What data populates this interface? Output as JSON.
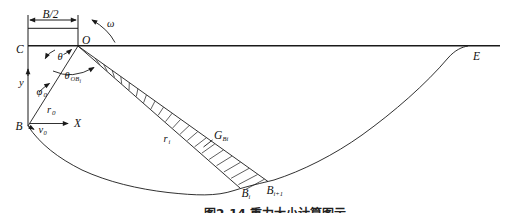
{
  "dim": {
    "label": "B/2"
  },
  "points": {
    "C": "C",
    "O": "O",
    "B": "B",
    "E": "E"
  },
  "axes": {
    "x": "X",
    "y": "y"
  },
  "angles": {
    "omega": "ω",
    "theta": "θ",
    "thetaOB": {
      "main": "θ",
      "sub": "OB",
      "subi": "i"
    },
    "phi": {
      "main": "φ",
      "sub": "0"
    }
  },
  "radii": {
    "r0": {
      "main": "r",
      "sub": "0"
    },
    "ri": {
      "main": "r",
      "sub": "i"
    }
  },
  "velocity": {
    "main": "v",
    "sub": "0"
  },
  "weight": {
    "main": "G",
    "sub": "Bi"
  },
  "slice": {
    "bi": {
      "main": "B",
      "sub": "i"
    },
    "bi1": {
      "main": "B",
      "sub": "i+1"
    }
  },
  "caption": "图2-14 重力大小计算图示",
  "colors": {
    "line": "#1a1a1a",
    "background": "#ffffff"
  }
}
